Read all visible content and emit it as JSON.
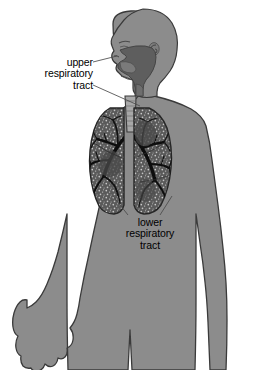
{
  "diagram": {
    "orientation": "anterior body with head in left profile",
    "background_color": "#ffffff"
  },
  "labels": {
    "upper": {
      "line1": "upper",
      "line2": "respiratory",
      "line3": "tract",
      "full_text": "upper respiratory tract",
      "align": "right",
      "leader_count": 2,
      "points_to": "nasal cavity and pharynx"
    },
    "lower": {
      "line1": "lower",
      "line2": "respiratory",
      "line3": "tract",
      "full_text": "lower respiratory tract",
      "align": "center",
      "leader_count": 2,
      "points_to": "left and right lung bases"
    }
  },
  "icons": {
    "body": "human-body-silhouette-icon",
    "head": "head-profile-icon",
    "ear": "ear-spiral-icon",
    "hand": "open-hand-icon",
    "lung_left": "lung-icon",
    "lung_right": "lung-icon",
    "trachea": "trachea-icon",
    "bronchial_tree": "bronchial-tree-icon",
    "airway_cavity": "upper-airway-cavity-icon"
  },
  "colors": {
    "background": "#ffffff",
    "body_fill": "#8c8c8c",
    "body_outline": "#3a3a3a",
    "airway_cavity": "#5e5e5e",
    "lung_fill": "#5a5a5a",
    "lung_outline": "#262626",
    "bronchi": "#0d0d0d",
    "alveolar_texture": "#c9c9c9",
    "trachea_fill": "#a8a8a8",
    "leader_line": "#4a4a4a",
    "text": "#000000"
  },
  "structures": [
    {
      "name": "nasal cavity",
      "group": "upper respiratory tract"
    },
    {
      "name": "oral cavity",
      "group": "upper respiratory tract"
    },
    {
      "name": "pharynx",
      "group": "upper respiratory tract"
    },
    {
      "name": "larynx",
      "group": "upper respiratory tract"
    },
    {
      "name": "trachea",
      "group": "lower respiratory tract"
    },
    {
      "name": "bronchi",
      "group": "lower respiratory tract"
    },
    {
      "name": "bronchioles",
      "group": "lower respiratory tract"
    },
    {
      "name": "lungs",
      "group": "lower respiratory tract"
    }
  ]
}
